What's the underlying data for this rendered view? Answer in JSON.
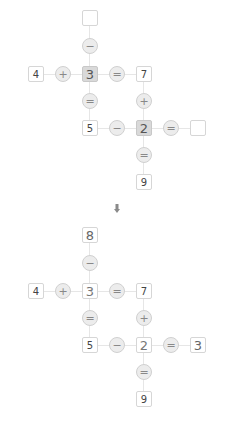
{
  "puzzle_before": {
    "cells": [
      {
        "id": "top",
        "value": "",
        "col": 2,
        "row": 0,
        "style": "empty"
      },
      {
        "id": "a",
        "value": "4",
        "col": 0,
        "row": 2,
        "style": "given"
      },
      {
        "id": "center1",
        "value": "3",
        "col": 2,
        "row": 2,
        "style": "shaded"
      },
      {
        "id": "b",
        "value": "7",
        "col": 4,
        "row": 2,
        "style": "given"
      },
      {
        "id": "c",
        "value": "5",
        "col": 2,
        "row": 4,
        "style": "given"
      },
      {
        "id": "center2",
        "value": "2",
        "col": 4,
        "row": 4,
        "style": "shaded"
      },
      {
        "id": "right",
        "value": "",
        "col": 6,
        "row": 4,
        "style": "empty"
      },
      {
        "id": "d",
        "value": "9",
        "col": 4,
        "row": 6,
        "style": "given"
      }
    ],
    "operators": [
      {
        "symbol": "−",
        "col": 2,
        "row": 1
      },
      {
        "symbol": "+",
        "col": 1,
        "row": 2
      },
      {
        "symbol": "=",
        "col": 3,
        "row": 2
      },
      {
        "symbol": "=",
        "col": 2,
        "row": 3
      },
      {
        "symbol": "+",
        "col": 4,
        "row": 3
      },
      {
        "symbol": "−",
        "col": 3,
        "row": 4
      },
      {
        "symbol": "=",
        "col": 5,
        "row": 4
      },
      {
        "symbol": "=",
        "col": 4,
        "row": 5
      }
    ]
  },
  "transition_arrow": "down-arrow",
  "puzzle_after": {
    "cells": [
      {
        "id": "top",
        "value": "8",
        "col": 2,
        "row": 0,
        "style": "filled"
      },
      {
        "id": "a",
        "value": "4",
        "col": 0,
        "row": 2,
        "style": "given"
      },
      {
        "id": "center1",
        "value": "3",
        "col": 2,
        "row": 2,
        "style": "answer"
      },
      {
        "id": "b",
        "value": "7",
        "col": 4,
        "row": 2,
        "style": "given"
      },
      {
        "id": "c",
        "value": "5",
        "col": 2,
        "row": 4,
        "style": "given"
      },
      {
        "id": "center2",
        "value": "2",
        "col": 4,
        "row": 4,
        "style": "answer"
      },
      {
        "id": "right",
        "value": "3",
        "col": 6,
        "row": 4,
        "style": "filled"
      },
      {
        "id": "d",
        "value": "9",
        "col": 4,
        "row": 6,
        "style": "given"
      }
    ],
    "operators": [
      {
        "symbol": "−",
        "col": 2,
        "row": 1
      },
      {
        "symbol": "+",
        "col": 1,
        "row": 2
      },
      {
        "symbol": "=",
        "col": 3,
        "row": 2
      },
      {
        "symbol": "=",
        "col": 2,
        "row": 3
      },
      {
        "symbol": "+",
        "col": 4,
        "row": 3
      },
      {
        "symbol": "−",
        "col": 3,
        "row": 4
      },
      {
        "symbol": "=",
        "col": 5,
        "row": 4
      },
      {
        "symbol": "=",
        "col": 4,
        "row": 5
      }
    ]
  },
  "colors": {
    "shaded_cell": "#d9d9d9",
    "operator_fill": "#ececec",
    "border": "#d6d6d6",
    "connector": "#e6e6e6"
  }
}
